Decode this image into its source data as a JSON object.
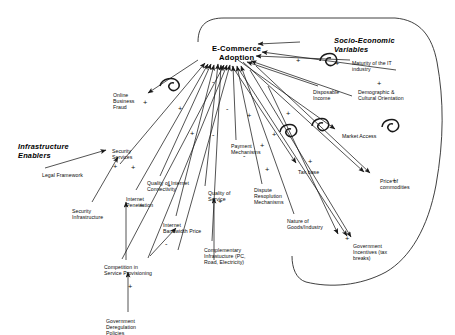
{
  "figure": {
    "type": "causal-loop-diagram",
    "background": "#ffffff",
    "line_color": "#1a1a1a"
  },
  "groups": [
    {
      "id": "socio-economic",
      "label": "Socio-Economic\nVariables",
      "x": 334,
      "y": 36
    },
    {
      "id": "infrastructure",
      "label": "Infrastructure\nEnablers",
      "x": 18,
      "y": 142
    }
  ],
  "core": {
    "id": "e-commerce-adoption",
    "label": "E-Commerce\nAdoption",
    "x": 212,
    "y": 44
  },
  "nodes": [
    {
      "id": "online-business-fraud",
      "label": "Online\nBusiness\nFraud",
      "x": 113,
      "y": 92,
      "align": "left"
    },
    {
      "id": "security-services",
      "label": "Security\nServices",
      "x": 112,
      "y": 148,
      "align": "left"
    },
    {
      "id": "legal-framework",
      "label": "Legal Framework",
      "x": 42,
      "y": 172,
      "align": "left"
    },
    {
      "id": "security-infrastructure",
      "label": "Security\nInfrastructure",
      "x": 72,
      "y": 208,
      "align": "left"
    },
    {
      "id": "internet-penetration",
      "label": "Internet\nPenetration",
      "x": 126,
      "y": 196,
      "align": "left"
    },
    {
      "id": "quality-of-internet-connectivity",
      "label": "Quality of Internet\nConnectivity",
      "x": 147,
      "y": 180,
      "align": "left"
    },
    {
      "id": "internet-bandwidth-price",
      "label": "Internet\nBandwidth Price",
      "x": 163,
      "y": 222,
      "align": "left"
    },
    {
      "id": "quality-of-service",
      "label": "Quality of\nService",
      "x": 208,
      "y": 190,
      "align": "left"
    },
    {
      "id": "complementary-infrastructure",
      "label": "Complementary\nInfrastucture (PC,\nRoad, Electricity)",
      "x": 204,
      "y": 247,
      "align": "left"
    },
    {
      "id": "competition-in-service-provisioning",
      "label": "Competition in\nService Provisioning",
      "x": 104,
      "y": 264,
      "align": "left"
    },
    {
      "id": "government-deregulation",
      "label": "Government\nDeregulation\nPolicies",
      "x": 106,
      "y": 318,
      "align": "left"
    },
    {
      "id": "payment-mechanisms",
      "label": "Payment\nMechanisms",
      "x": 231,
      "y": 143,
      "align": "left"
    },
    {
      "id": "dispute-resolution-mechanisms",
      "label": "Dispute\nResoplution\nMechanisms",
      "x": 254,
      "y": 187,
      "align": "left"
    },
    {
      "id": "nature-of-goods-industry",
      "label": "Nature of\nGoods/Industry",
      "x": 287,
      "y": 218,
      "align": "left"
    },
    {
      "id": "disposable-income",
      "label": "Disposable\nIncome",
      "x": 313,
      "y": 89,
      "align": "left"
    },
    {
      "id": "maturity-of-the-it-industry",
      "label": "Maturity of the IT\nindustry",
      "x": 352,
      "y": 60,
      "align": "left"
    },
    {
      "id": "demographic-cultural-orientation",
      "label": "Demographic &\nCultural Orientation",
      "x": 358,
      "y": 89,
      "align": "left"
    },
    {
      "id": "market-access",
      "label": "Market Access",
      "x": 342,
      "y": 133,
      "align": "left"
    },
    {
      "id": "tax-base",
      "label": "Tax base",
      "x": 298,
      "y": 169,
      "align": "left"
    },
    {
      "id": "price-of-commodities",
      "label": "Price of\ncommodities",
      "x": 380,
      "y": 178,
      "align": "left"
    },
    {
      "id": "government-incentives",
      "label": "Government\nIncentives (tax\nbreaks)",
      "x": 353,
      "y": 243,
      "align": "left"
    }
  ],
  "polarity_marks": [
    {
      "sign": "+",
      "x": 296,
      "y": 57
    },
    {
      "sign": "+",
      "x": 335,
      "y": 60
    },
    {
      "sign": "+",
      "x": 377,
      "y": 80
    },
    {
      "sign": "+",
      "x": 143,
      "y": 99
    },
    {
      "sign": "+",
      "x": 178,
      "y": 105
    },
    {
      "sign": "-",
      "x": 212,
      "y": 78
    },
    {
      "sign": "-",
      "x": 226,
      "y": 105
    },
    {
      "sign": "+",
      "x": 247,
      "y": 112
    },
    {
      "sign": "+",
      "x": 286,
      "y": 110
    },
    {
      "sign": "+",
      "x": 190,
      "y": 130
    },
    {
      "sign": "-",
      "x": 212,
      "y": 131
    },
    {
      "sign": "+",
      "x": 272,
      "y": 131
    },
    {
      "sign": "-",
      "x": 330,
      "y": 121
    },
    {
      "sign": "+",
      "x": 260,
      "y": 142
    },
    {
      "sign": "-",
      "x": 243,
      "y": 152
    },
    {
      "sign": "+",
      "x": 308,
      "y": 158
    },
    {
      "sign": "+",
      "x": 113,
      "y": 163
    },
    {
      "sign": "+",
      "x": 131,
      "y": 164
    },
    {
      "sign": "+",
      "x": 265,
      "y": 166
    },
    {
      "sign": "+",
      "x": 167,
      "y": 182
    },
    {
      "sign": "+",
      "x": 218,
      "y": 198
    },
    {
      "sign": "+",
      "x": 139,
      "y": 202
    },
    {
      "sign": "+",
      "x": 392,
      "y": 177
    },
    {
      "sign": "-",
      "x": 165,
      "y": 240
    },
    {
      "sign": "+",
      "x": 345,
      "y": 235
    },
    {
      "sign": "+",
      "x": 128,
      "y": 283
    }
  ]
}
